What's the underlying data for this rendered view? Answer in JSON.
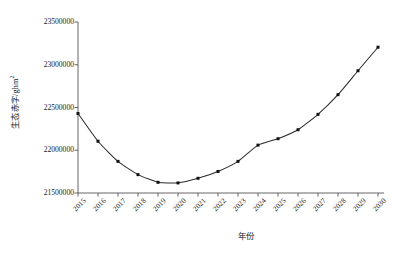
{
  "chart_data": {
    "type": "line",
    "title": "",
    "xlabel": "年份",
    "ylabel": "生态赤字/ghm²",
    "ylabel_main": "生态赤字/ghm",
    "ylabel_sup": "2",
    "categories": [
      "2015",
      "2016",
      "2017",
      "2018",
      "2019",
      "2020",
      "2021",
      "2022",
      "2023",
      "2024",
      "2025",
      "2026",
      "2027",
      "2028",
      "2029",
      "2030"
    ],
    "values": [
      22430000,
      22105000,
      21870000,
      21715000,
      21625000,
      21618000,
      21672000,
      21752000,
      21870000,
      22060000,
      22135000,
      22240000,
      22420000,
      22650000,
      22930000,
      23205000
    ],
    "xlim": [
      "2015",
      "2030"
    ],
    "ylim": [
      21500000,
      23500000
    ],
    "ytick_values": [
      23500000,
      23000000,
      22500000,
      22000000,
      21500000
    ],
    "ytick_labels": [
      "23500000",
      "23000000",
      "22500000",
      "22000000",
      "21500000"
    ],
    "grid": false,
    "legend": null,
    "marker": "square",
    "line_color": "#2b2b2b",
    "marker_color": "#111111",
    "background_color": "#ffffff",
    "axis_color": "#555555"
  }
}
